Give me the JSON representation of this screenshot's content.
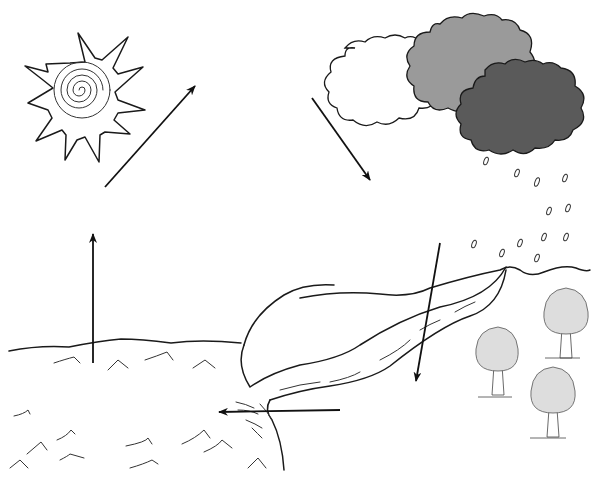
{
  "diagram": {
    "type": "water-cycle",
    "elements": [
      {
        "id": "sun",
        "label": ""
      },
      {
        "id": "cloud-white",
        "color": "#ffffff"
      },
      {
        "id": "cloud-grey",
        "color": "#9a9a9a"
      },
      {
        "id": "cloud-dark",
        "color": "#5a5a5a"
      },
      {
        "id": "rain",
        "label": ""
      },
      {
        "id": "hills",
        "label": ""
      },
      {
        "id": "river",
        "label": ""
      },
      {
        "id": "lake",
        "label": ""
      },
      {
        "id": "sea",
        "label": ""
      },
      {
        "id": "trees",
        "count": 3
      }
    ],
    "arrows": [
      {
        "id": "sun-to-sky",
        "from": [
          105,
          187
        ],
        "to": [
          195,
          85
        ]
      },
      {
        "id": "cloud-to-ground",
        "from": [
          312,
          98
        ],
        "to": [
          370,
          180
        ]
      },
      {
        "id": "evaporation",
        "from": [
          93,
          363
        ],
        "to": [
          93,
          232
        ]
      },
      {
        "id": "infiltration",
        "from": [
          440,
          243
        ],
        "to": [
          416,
          383
        ]
      },
      {
        "id": "runoff",
        "from": [
          340,
          410
        ],
        "to": [
          217,
          412
        ]
      }
    ],
    "colors": {
      "ink": "#1a1a1a",
      "background": "#ffffff",
      "cloud_grey": "#9a9a9a",
      "cloud_dark": "#5a5a5a"
    }
  }
}
